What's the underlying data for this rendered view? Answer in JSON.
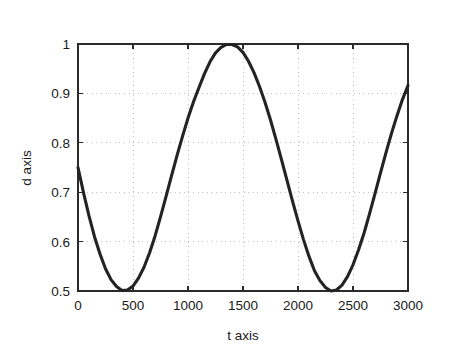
{
  "figure": {
    "background_color": "#ffffff",
    "axes_color": "#2b2b2b",
    "grid_color": "#b9b9b9",
    "curve_color": "#232323"
  },
  "chart_data": {
    "type": "line",
    "title": "",
    "xlabel": "t axis",
    "ylabel": "d axis",
    "xlim": [
      0,
      3000
    ],
    "ylim": [
      0.5,
      1
    ],
    "xticks": [
      0,
      500,
      1000,
      1500,
      2000,
      2500,
      3000
    ],
    "xtick_labels": [
      "0",
      "500",
      "1000",
      "1500",
      "2000",
      "2500",
      "3000"
    ],
    "yticks": [
      0.5,
      0.6,
      0.7,
      0.8,
      0.9,
      1
    ],
    "ytick_labels": [
      "0.5",
      "0.6",
      "0.7",
      "0.8",
      "0.9",
      "1"
    ],
    "grid": true,
    "grid_style": "dotted",
    "legend": null,
    "series": [
      {
        "name": "d",
        "description": "sinusoid, amplitude 0.25, offset 0.75, period approx 1520, minimum near t=370, maxima near t=1110 and t=2630",
        "amplitude": 0.25,
        "offset": 0.75,
        "period": 1520,
        "phase_min_t": 370,
        "x": [
          0,
          50,
          100,
          150,
          200,
          250,
          300,
          350,
          400,
          450,
          500,
          550,
          600,
          650,
          700,
          750,
          800,
          850,
          900,
          950,
          1000,
          1050,
          1100,
          1150,
          1200,
          1250,
          1300,
          1350,
          1400,
          1450,
          1500,
          1550,
          1600,
          1650,
          1700,
          1750,
          1800,
          1850,
          1900,
          1950,
          2000,
          2050,
          2100,
          2150,
          2200,
          2250,
          2300,
          2350,
          2400,
          2450,
          2500,
          2550,
          2600,
          2650,
          2700,
          2750,
          2800,
          2850,
          2900,
          2950,
          3000
        ],
        "y": [
          0.75,
          0.699,
          0.652,
          0.61,
          0.575,
          0.545,
          0.523,
          0.509,
          0.501,
          0.502,
          0.51,
          0.526,
          0.548,
          0.577,
          0.611,
          0.65,
          0.691,
          0.733,
          0.774,
          0.813,
          0.85,
          0.883,
          0.912,
          0.94,
          0.964,
          0.982,
          0.993,
          0.999,
          0.999,
          0.994,
          0.983,
          0.965,
          0.942,
          0.914,
          0.882,
          0.846,
          0.807,
          0.766,
          0.724,
          0.682,
          0.642,
          0.604,
          0.57,
          0.541,
          0.521,
          0.507,
          0.5,
          0.502,
          0.512,
          0.529,
          0.553,
          0.583,
          0.617,
          0.656,
          0.697,
          0.739,
          0.78,
          0.819,
          0.855,
          0.888,
          0.916
        ]
      }
    ]
  }
}
